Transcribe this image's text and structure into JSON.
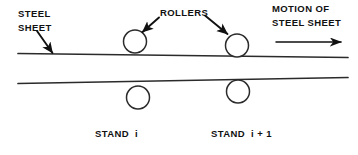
{
  "figure": {
    "kind": "engineering-schematic",
    "width_px": 358,
    "height_px": 155,
    "background_color": "#ffffff",
    "line_color": "#2b2b2b",
    "text_color": "#111111"
  },
  "labels": {
    "steel_sheet": {
      "line1": "STEEL",
      "line2": "SHEET"
    },
    "rollers": "ROLLERS",
    "motion": {
      "line1": "MOTION OF",
      "line2": "STEEL SHEET"
    },
    "stand_i": "STAND  i",
    "stand_i_plus_1": "STAND  i + 1"
  },
  "geometry": {
    "sheet": {
      "top_edge": {
        "x1": 18,
        "y1": 53.5,
        "x2": 348,
        "y2": 57.5
      },
      "bottom_edge": {
        "x1": 18,
        "y1": 83.5,
        "x2": 348,
        "y2": 77.5
      },
      "entry_thickness_px": 30,
      "exit_thickness_px": 20
    },
    "rollers": [
      {
        "id": "upper-roller-stand-i",
        "cx": 135,
        "cy": 41.5,
        "r": 11.5,
        "position": "upper",
        "stand": "i"
      },
      {
        "id": "lower-roller-stand-i",
        "cx": 138,
        "cy": 97.5,
        "r": 11.5,
        "position": "lower",
        "stand": "i"
      },
      {
        "id": "upper-roller-stand-i-plus-1",
        "cx": 237,
        "cy": 45.5,
        "r": 11.5,
        "position": "upper",
        "stand": "i+1"
      },
      {
        "id": "lower-roller-stand-i-plus-1",
        "cx": 238,
        "cy": 91.5,
        "r": 11.5,
        "position": "lower",
        "stand": "i+1"
      }
    ],
    "pointers": [
      {
        "id": "steel-sheet-pointer",
        "x1": 37,
        "y1": 32,
        "x2": 53,
        "y2": 54
      },
      {
        "id": "rollers-pointer-left",
        "x1": 158,
        "y1": 17,
        "x2": 142,
        "y2": 32
      },
      {
        "id": "rollers-pointer-right",
        "x1": 206,
        "y1": 16,
        "x2": 228,
        "y2": 34
      }
    ],
    "motion_arrow": {
      "x1": 276,
      "y1": 42,
      "x2": 344,
      "y2": 42,
      "direction": "right"
    }
  },
  "text_positions": {
    "steel_sheet_line1": {
      "x": 18,
      "y": 17
    },
    "steel_sheet_line2": {
      "x": 18,
      "y": 31
    },
    "rollers": {
      "x": 160,
      "y": 16
    },
    "motion_line1": {
      "x": 272,
      "y": 12
    },
    "motion_line2": {
      "x": 272,
      "y": 26
    },
    "stand_i": {
      "x": 95,
      "y": 137
    },
    "stand_i_plus_1": {
      "x": 211,
      "y": 137
    }
  }
}
